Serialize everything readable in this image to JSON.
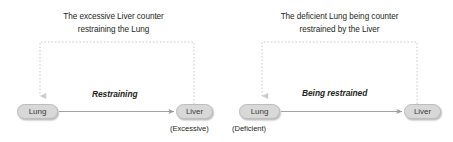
{
  "figure": {
    "title_hidden": "",
    "panels": [
      {
        "id": "excessive-liver-counterrestraining-lung",
        "caption_line1": "The excessive Liver counter",
        "caption_line2": "restraining the Lung",
        "source_node": {
          "label": "Lung",
          "state": ""
        },
        "target_node": {
          "label": "Liver",
          "state": "(Excessive)"
        },
        "edge_label": "Restraining",
        "feedback_arrow": "dashed-counterrestraining-arrow"
      },
      {
        "id": "deficient-lung-being-counterrestrained-by-liver",
        "caption_line1": "The deficient Lung being counter",
        "caption_line2": "restrained by the Liver",
        "source_node": {
          "label": "Lung",
          "state": "(Deficient)"
        },
        "target_node": {
          "label": "Liver",
          "state": ""
        },
        "edge_label": "Being restrained",
        "feedback_arrow": "dashed-counterrestraining-arrow"
      }
    ]
  },
  "colors": {
    "node_fill": "#d8d8d8",
    "node_border": "#bdbdbd",
    "node_text": "#3b3b3b",
    "body_text": "#231f20",
    "solid_arrow": "#9a9a9a",
    "dashed_arrow": "#c9c9c9",
    "background": "#ffffff"
  }
}
